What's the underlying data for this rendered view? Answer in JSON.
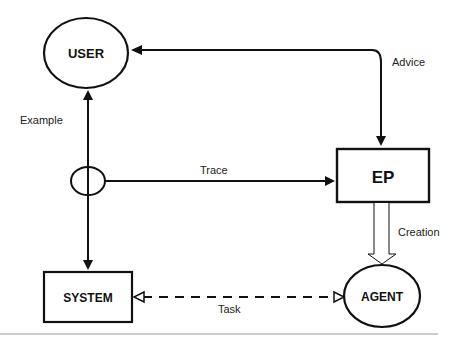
{
  "diagram": {
    "nodes": {
      "user": {
        "label": "USER",
        "shape": "ellipse"
      },
      "system": {
        "label": "SYSTEM",
        "shape": "rectangle"
      },
      "ep": {
        "label": "EP",
        "shape": "rectangle"
      },
      "agent": {
        "label": "AGENT",
        "shape": "ellipse"
      },
      "junction": {
        "label": "",
        "shape": "small-ellipse"
      }
    },
    "edges": {
      "example": {
        "label": "Example",
        "from": "junction",
        "to": "user",
        "style": "solid"
      },
      "advice": {
        "label": "Advice",
        "from": "ep",
        "to": "user",
        "style": "solid"
      },
      "trace": {
        "label": "Trace",
        "from": "junction",
        "to": "ep",
        "style": "solid"
      },
      "creation": {
        "label": "Creation",
        "from": "ep",
        "to": "agent",
        "style": "hollow-double"
      },
      "task": {
        "label": "Task",
        "from": "system",
        "to": "agent",
        "style": "dashed-bidirectional"
      },
      "to_system": {
        "label": "",
        "from": "junction",
        "to": "system",
        "style": "solid"
      }
    },
    "colors": {
      "stroke": "#111111",
      "background": "#ffffff",
      "footer_rule": "#999999"
    }
  }
}
